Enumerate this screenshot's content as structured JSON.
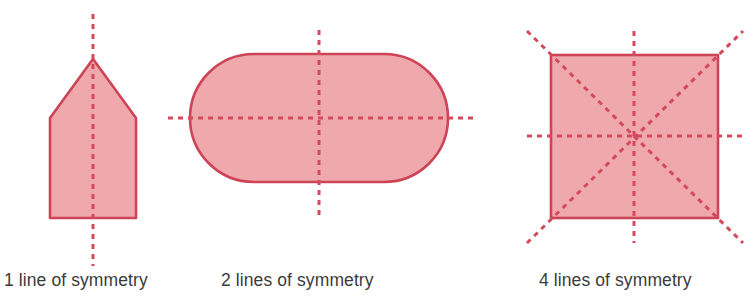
{
  "figure": {
    "background_color": "#ffffff",
    "fill_color": "#efa9ac",
    "stroke_color": "#cc4455",
    "dash_color": "#d44a5c",
    "caption_color": "#3b3b3b",
    "stroke_width": 2.6,
    "dash_width": 3,
    "dash_pattern": "5,5"
  },
  "shapes": [
    {
      "id": "pentagon",
      "name": "pentagon-house-shape",
      "description": "Upward-pointing pentagon resembling a house",
      "lines_of_symmetry": 1,
      "caption": "1 line of symmetry",
      "points": "93,59 136,118 136,218 50,218 50,118",
      "symmetry_lines": [
        {
          "name": "vertical",
          "x1": 93,
          "y1": 14,
          "x2": 93,
          "y2": 266
        }
      ]
    },
    {
      "id": "stadium",
      "name": "stadium-rounded-rectangle",
      "description": "Horizontal stadium / rounded rectangle shape",
      "lines_of_symmetry": 2,
      "caption": "2 lines of symmetry",
      "rect": {
        "x": 190,
        "y": 54,
        "width": 258,
        "height": 128,
        "rx": 64,
        "ry": 64
      },
      "symmetry_lines": [
        {
          "name": "vertical",
          "x1": 319,
          "y1": 30,
          "x2": 319,
          "y2": 216
        },
        {
          "name": "horizontal",
          "x1": 168,
          "y1": 118,
          "x2": 473,
          "y2": 118
        }
      ]
    },
    {
      "id": "square",
      "name": "square-shape",
      "description": "Square with four lines of symmetry",
      "lines_of_symmetry": 4,
      "caption": "4 lines of symmetry",
      "rect": {
        "x": 551,
        "y": 55,
        "width": 167,
        "height": 163
      },
      "symmetry_lines": [
        {
          "name": "vertical",
          "x1": 634,
          "y1": 31,
          "x2": 634,
          "y2": 243
        },
        {
          "name": "horizontal",
          "x1": 527,
          "y1": 136,
          "x2": 743,
          "y2": 136
        },
        {
          "name": "diagonal-nwse",
          "x1": 527,
          "y1": 31,
          "x2": 743,
          "y2": 243
        },
        {
          "name": "diagonal-swne",
          "x1": 527,
          "y1": 243,
          "x2": 743,
          "y2": 31
        }
      ]
    }
  ],
  "captions": {
    "one": "1 line of symmetry",
    "two": "2 lines of symmetry",
    "four": "4 lines of symmetry"
  }
}
